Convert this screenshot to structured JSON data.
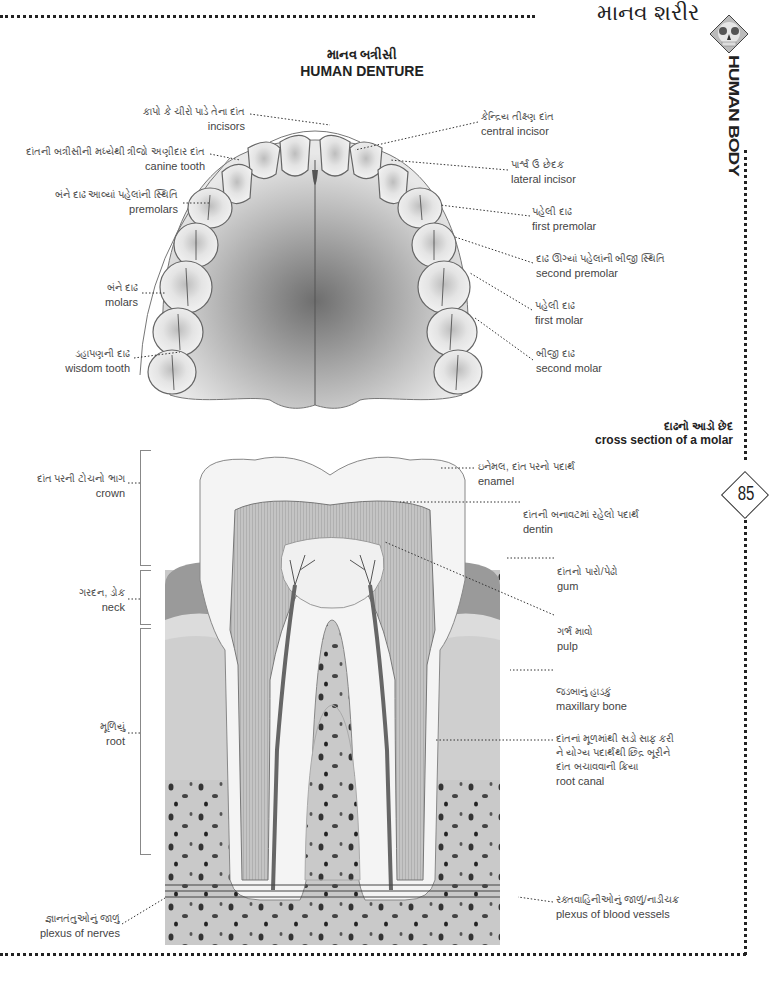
{
  "header": {
    "section_title_gu": "માનવ શરીર",
    "side_title": "HUMAN BODY",
    "section_icon": "skull-icon",
    "page_number": "85"
  },
  "denture": {
    "title_gu": "માનવ બત્રીસી",
    "title_en": "HUMAN DENTURE",
    "labels_left": [
      {
        "gu": "કાપો કે ચીરો પાડે તેના દાંત",
        "en": "incisors"
      },
      {
        "gu": "દાંતની બત્રીસીની મધ્યેથી ત્રીજો અણીદાર દાંત",
        "en": "canine tooth"
      },
      {
        "gu": "બંને દાઢ આવ્યાં પહેલાંની સ્થિતિ",
        "en": "premolars"
      },
      {
        "gu": "બંને દાઢ",
        "en": "molars"
      },
      {
        "gu": "ડહાપણની દાઢ",
        "en": "wisdom tooth"
      }
    ],
    "labels_right": [
      {
        "gu": "કેન્દ્રિય તીક્ષ્ણ દાંત",
        "en": "central incisor"
      },
      {
        "gu": "પાર્શ્વ ઉ છેદક",
        "en": "lateral incisor"
      },
      {
        "gu": "પહેલી દાઢ",
        "en": "first premolar"
      },
      {
        "gu": "દાઢ ઊગ્યાં પહેલાંની બીજી સ્થિતિ",
        "en": "second premolar"
      },
      {
        "gu": "પહેલી દાઢ",
        "en": "first molar"
      },
      {
        "gu": "બીજી દાઢ",
        "en": "second molar"
      }
    ]
  },
  "molar": {
    "title_gu": "દાઢનો આડો છેદ",
    "title_en": "cross section of a molar",
    "labels_left": [
      {
        "gu": "દાંત પરની ટોચનો ભાગ",
        "en": "crown"
      },
      {
        "gu": "ગરદન, ડોક",
        "en": "neck"
      },
      {
        "gu": "મૂળિયું",
        "en": "root"
      },
      {
        "gu": "જ્ઞાનતંતુઓનું જાળું",
        "en": "plexus of nerves"
      }
    ],
    "labels_right": [
      {
        "gu": "ઇનેમલ, દાંત પરનો પદાર્થ",
        "en": "enamel"
      },
      {
        "gu": "દાંતની બનાવટમાં રહેલો પદાર્થ",
        "en": "dentin"
      },
      {
        "gu": "દાંતનો પારો/પેઢો",
        "en": "gum"
      },
      {
        "gu": "ગર્ભ માવો",
        "en": "pulp"
      },
      {
        "gu": "જડબાનું હાડકું",
        "en": "maxillary bone"
      },
      {
        "gu_lines": [
          "દાંતનાં મૂળમાંથી સડો સાફ કરી",
          "ને યોગ્ય પદાર્થથી છિદ્ર બૂરીને",
          "દાંત બચાવવાની ક્રિયા"
        ],
        "en": "root canal"
      },
      {
        "gu": "રક્તવાહિનીઓનું જાળું/નાડીચક્ર",
        "en": "plexus of blood vessels"
      }
    ]
  },
  "colors": {
    "tooth": "#f2f2f2",
    "gum": "#9a9a9a",
    "bone": "#c9c9c9",
    "dentin": "#b5b5b5",
    "palate_dark": "#7a7a7a",
    "ink": "#222222"
  }
}
